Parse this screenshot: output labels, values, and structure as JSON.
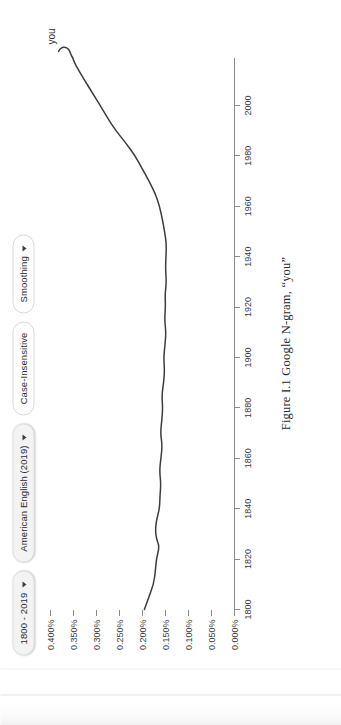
{
  "toolbar": {
    "buttons": [
      {
        "label": "1800 - 2019",
        "icon": "chevron-down-icon",
        "has_caret": true,
        "style": "raised",
        "name": "date-range-button"
      },
      {
        "label": "American English (2019)",
        "icon": "chevron-down-icon",
        "has_caret": true,
        "style": "raised",
        "name": "corpus-button"
      },
      {
        "label": "Case-Insensitive",
        "icon": "",
        "has_caret": false,
        "style": "plain",
        "name": "case-insensitive-button"
      },
      {
        "label": "Smoothing",
        "icon": "chevron-down-icon",
        "has_caret": true,
        "style": "plain",
        "name": "smoothing-button"
      }
    ]
  },
  "caption": {
    "text": "Figure I.1  Google N-gram, “you”"
  },
  "colors": {
    "series": "#3c3c3c",
    "axis": "#8a8a8a",
    "tick_text": "#3a3a3a",
    "pill_border": "#d8d8d8",
    "pill_raised_bg": "#f3f3f3",
    "background": "#ffffff"
  },
  "chart_data": {
    "type": "line",
    "title": "",
    "subtitle": "",
    "xlabel": "",
    "ylabel": "",
    "grid": false,
    "legend_position": "inline-end-of-line",
    "xlim": [
      1800,
      2019
    ],
    "ylim": [
      0.0,
      0.4
    ],
    "x_ticks": [
      1800,
      1820,
      1840,
      1860,
      1880,
      1900,
      1920,
      1940,
      1960,
      1980,
      2000
    ],
    "x_tick_labels": [
      "1800",
      "1820",
      "1840",
      "1860",
      "1880",
      "1900",
      "1920",
      "1940",
      "1960",
      "1980",
      "2000"
    ],
    "y_ticks": [
      0.0,
      0.05,
      0.1,
      0.15,
      0.2,
      0.25,
      0.3,
      0.35,
      0.4
    ],
    "y_tick_labels": [
      "0.000%",
      "0.050%",
      "0.100%",
      "0.150%",
      "0.200%",
      "0.250%",
      "0.300%",
      "0.350%",
      "0.400%"
    ],
    "y_unit": "%",
    "series": [
      {
        "name": "you",
        "label": "you",
        "color": "#3c3c3c",
        "x": [
          1800,
          1805,
          1810,
          1815,
          1820,
          1825,
          1828,
          1832,
          1836,
          1840,
          1845,
          1850,
          1855,
          1860,
          1865,
          1870,
          1875,
          1880,
          1885,
          1890,
          1895,
          1900,
          1905,
          1910,
          1915,
          1920,
          1925,
          1930,
          1935,
          1940,
          1945,
          1950,
          1955,
          1960,
          1965,
          1970,
          1975,
          1980,
          1985,
          1990,
          1995,
          2000,
          2005,
          2010,
          2014,
          2017,
          2019
        ],
        "values": [
          0.196,
          0.186,
          0.176,
          0.172,
          0.17,
          0.163,
          0.17,
          0.172,
          0.169,
          0.163,
          0.162,
          0.16,
          0.163,
          0.16,
          0.157,
          0.161,
          0.158,
          0.156,
          0.158,
          0.154,
          0.152,
          0.154,
          0.151,
          0.149,
          0.152,
          0.15,
          0.151,
          0.148,
          0.15,
          0.149,
          0.148,
          0.152,
          0.157,
          0.163,
          0.172,
          0.186,
          0.201,
          0.216,
          0.236,
          0.258,
          0.276,
          0.292,
          0.309,
          0.326,
          0.339,
          0.348,
          0.352
        ]
      }
    ],
    "annotations": [
      {
        "text": "you",
        "x": 2019,
        "y": 0.352,
        "name": "series-end-label"
      }
    ]
  }
}
